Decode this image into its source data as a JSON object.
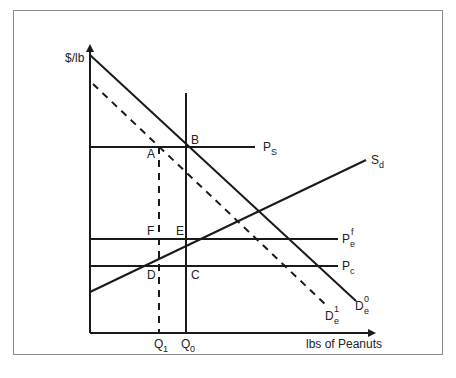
{
  "diagram": {
    "y_axis_label": "$/lb",
    "x_axis_label": "lbs of Peanuts",
    "points": {
      "A": "A",
      "B": "B",
      "C": "C",
      "D": "D",
      "E": "E",
      "F": "F"
    },
    "curves": {
      "ps": {
        "base": "P",
        "sub": "S"
      },
      "sd": {
        "base": "S",
        "sub": "d"
      },
      "pef": {
        "base": "P",
        "sub": "e",
        "sup": "f"
      },
      "pc": {
        "base": "P",
        "sub": "c"
      },
      "de0": {
        "base": "D",
        "sub": "e",
        "sup": "0"
      },
      "de1": {
        "base": "D",
        "sub": "e",
        "sup": "1"
      }
    },
    "quantities": {
      "q1": {
        "base": "Q",
        "sub": "1"
      },
      "q0": {
        "base": "Q",
        "sub": "0"
      }
    },
    "colors": {
      "line": "#1a1a1a",
      "frame": "#8a8a8a"
    }
  }
}
